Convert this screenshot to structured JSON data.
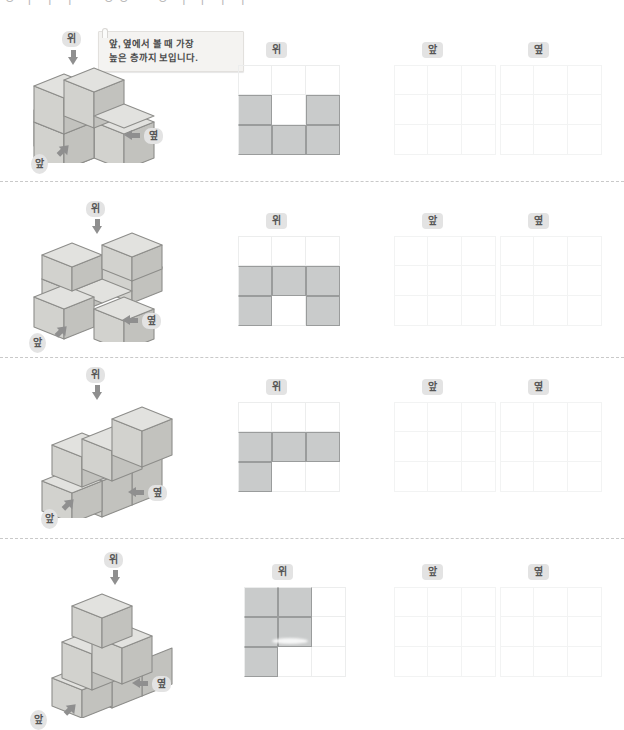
{
  "header": {
    "clipped_text": "ㅇ ㅏ ㅣ ㅣ ㅡ ㅇㅇ ㅡ ㅇ ㅓ ㅏ ㅣ ㅣ"
  },
  "bubble": {
    "line1": "앞, 옆에서 볼 때 가장",
    "line2": "높은 층까지 보입니다."
  },
  "labels": {
    "top": "위",
    "front": "앞",
    "side": "옆"
  },
  "colors": {
    "cube_top": "#e2e2df",
    "cube_front": "#d2d2ce",
    "cube_side": "#c2c2be",
    "cube_stroke": "#8d8d8a",
    "cell_fill": "#c9cbcb",
    "cell_stroke": "#9a9c9c",
    "grid_line": "#eceded",
    "grid_line_faint": "#f2f3f3",
    "badge_bg": "#e3e3e3",
    "badge_text": "#555555",
    "arrow": "#8f8f8f",
    "separator": "#c9c9c9",
    "bubble_bg": "#f4f3f1"
  },
  "problems": [
    {
      "id": 1,
      "top_label": "위",
      "front_label": "앞",
      "side_label": "옆",
      "top_view": [
        [
          0,
          0,
          0
        ],
        [
          1,
          0,
          1
        ],
        [
          1,
          1,
          1
        ]
      ],
      "front_view": [
        [
          0,
          0,
          0
        ],
        [
          0,
          0,
          0
        ],
        [
          0,
          0,
          0
        ]
      ],
      "side_view": [
        [
          0,
          0,
          0
        ],
        [
          0,
          0,
          0
        ],
        [
          0,
          0,
          0
        ]
      ]
    },
    {
      "id": 2,
      "top_label": "위",
      "front_label": "앞",
      "side_label": "옆",
      "top_view": [
        [
          0,
          0,
          0
        ],
        [
          1,
          1,
          1
        ],
        [
          1,
          0,
          1
        ]
      ],
      "front_view": [
        [
          0,
          0,
          0
        ],
        [
          0,
          0,
          0
        ],
        [
          0,
          0,
          0
        ]
      ],
      "side_view": [
        [
          0,
          0,
          0
        ],
        [
          0,
          0,
          0
        ],
        [
          0,
          0,
          0
        ]
      ]
    },
    {
      "id": 3,
      "top_label": "위",
      "front_label": "앞",
      "side_label": "옆",
      "top_view": [
        [
          0,
          0,
          0
        ],
        [
          1,
          1,
          1
        ],
        [
          1,
          0,
          0
        ]
      ],
      "front_view": [
        [
          0,
          0,
          0
        ],
        [
          0,
          0,
          0
        ],
        [
          0,
          0,
          0
        ]
      ],
      "side_view": [
        [
          0,
          0,
          0
        ],
        [
          0,
          0,
          0
        ],
        [
          0,
          0,
          0
        ]
      ]
    },
    {
      "id": 4,
      "top_label": "위",
      "front_label": "앞",
      "side_label": "옆",
      "top_view": [
        [
          1,
          1,
          0
        ],
        [
          1,
          1,
          0
        ],
        [
          1,
          0,
          0
        ]
      ],
      "front_view": [
        [
          0,
          0,
          0
        ],
        [
          0,
          0,
          0
        ],
        [
          0,
          0,
          0
        ]
      ],
      "side_view": [
        [
          0,
          0,
          0
        ],
        [
          0,
          0,
          0
        ],
        [
          0,
          0,
          0
        ]
      ]
    }
  ]
}
